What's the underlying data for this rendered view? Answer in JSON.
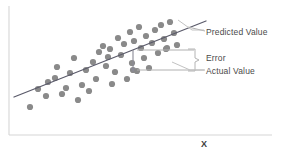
{
  "figure": {
    "background_color": "#ffffff",
    "axes": {
      "x_axis_label": "X",
      "y_axis_label": "",
      "axis_color": "#d0d0d0"
    },
    "annotations": {
      "predicted_value": "Predicted Value",
      "error": "Error",
      "actual_value": "Actual Value"
    },
    "colors": {
      "point_fill": "#8a8a8a",
      "regression_line": "#5a5a6a",
      "leader_line": "#b0b0b0",
      "text": "#4a4a4a"
    }
  },
  "chart_data": {
    "type": "scatter",
    "title": "",
    "xlabel": "X",
    "ylabel": "",
    "xlim": [
      0,
      287
    ],
    "ylim": [
      0,
      157
    ],
    "grid": false,
    "legend": "none",
    "point_radius": 3.1,
    "points": [
      [
        30,
        107
      ],
      [
        38,
        89
      ],
      [
        46,
        96
      ],
      [
        48,
        82
      ],
      [
        55,
        78
      ],
      [
        57,
        67
      ],
      [
        62,
        94
      ],
      [
        66,
        88
      ],
      [
        70,
        73
      ],
      [
        74,
        58
      ],
      [
        78,
        100
      ],
      [
        82,
        85
      ],
      [
        86,
        70
      ],
      [
        89,
        91
      ],
      [
        93,
        62
      ],
      [
        96,
        79
      ],
      [
        99,
        52
      ],
      [
        103,
        46
      ],
      [
        106,
        66
      ],
      [
        108,
        57
      ],
      [
        110,
        49
      ],
      [
        112,
        84
      ],
      [
        115,
        72
      ],
      [
        118,
        38
      ],
      [
        121,
        55
      ],
      [
        124,
        44
      ],
      [
        127,
        79
      ],
      [
        130,
        32
      ],
      [
        132,
        63
      ],
      [
        134,
        41
      ],
      [
        137,
        71
      ],
      [
        139,
        27
      ],
      [
        141,
        48
      ],
      [
        144,
        58
      ],
      [
        146,
        36
      ],
      [
        149,
        68
      ],
      [
        152,
        43
      ],
      [
        155,
        30
      ],
      [
        158,
        53
      ],
      [
        161,
        25
      ],
      [
        164,
        39
      ],
      [
        167,
        48
      ],
      [
        170,
        22
      ],
      [
        174,
        33
      ],
      [
        177,
        45
      ],
      [
        133,
        70
      ],
      [
        166,
        49
      ]
    ],
    "regression_line": {
      "name": "Predicted Value",
      "x1": 14,
      "y1": 97,
      "x2": 206,
      "y2": 21
    },
    "error_marker": {
      "name": "Error",
      "x": 133,
      "y_predicted": 50,
      "y_actual": 70
    },
    "leader_lines": [
      {
        "name": "predicted-leader",
        "x1": 188,
        "y1": 27,
        "x2": 205,
        "y2": 31
      },
      {
        "name": "error-bracket-top",
        "x1": 137,
        "y1": 50,
        "x2": 194,
        "y2": 50
      },
      {
        "name": "error-bracket-bottom",
        "x1": 137,
        "y1": 70,
        "x2": 194,
        "y2": 70
      },
      {
        "name": "actual-leader",
        "x1": 194,
        "y1": 70,
        "x2": 205,
        "y2": 70
      }
    ]
  }
}
